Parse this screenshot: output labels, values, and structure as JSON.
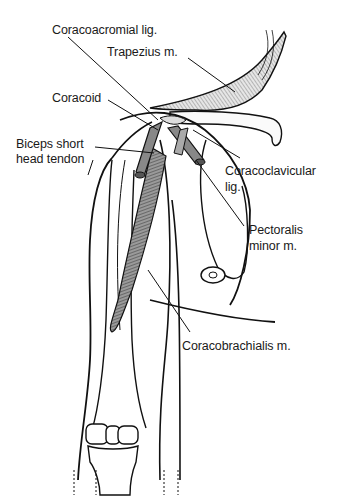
{
  "diagram": {
    "type": "anatomical-illustration",
    "stroke_color": "#111111",
    "muscle_fill": "#7a7a7a",
    "background": "#ffffff"
  },
  "labels": {
    "coracoacromial": "Coracoacromial lig.",
    "trapezius": "Trapezius m.",
    "coracoid": "Coracoid",
    "biceps_line1": "Biceps short",
    "biceps_line2": "head tendon",
    "coracoclavicular_line1": "Coracoclavicular",
    "coracoclavicular_line2": "lig.",
    "pectoralis_line1": "Pectoralis",
    "pectoralis_line2": "minor m.",
    "coracobrachialis": "Coracobrachialis m."
  }
}
